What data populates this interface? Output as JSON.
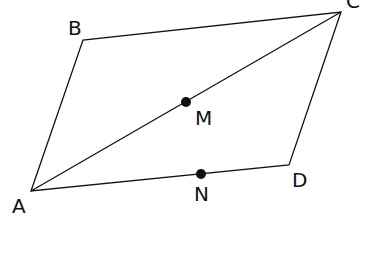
{
  "diagram": {
    "title": "",
    "points": {
      "A": {
        "label": "A",
        "x": 31,
        "y": 191
      },
      "B": {
        "label": "B",
        "x": 83,
        "y": 40
      },
      "C": {
        "label": "C",
        "x": 341,
        "y": 12
      },
      "D": {
        "label": "D",
        "x": 289,
        "y": 165
      },
      "M": {
        "label": "M",
        "x": 186,
        "y": 102
      },
      "N": {
        "label": "N",
        "x": 201,
        "y": 174
      }
    },
    "segments": [
      "AB",
      "BC",
      "CD",
      "DA",
      "AC"
    ],
    "marked_points": [
      "M",
      "N"
    ],
    "colors": {
      "stroke": "#111111",
      "background": "#ffffff"
    }
  }
}
